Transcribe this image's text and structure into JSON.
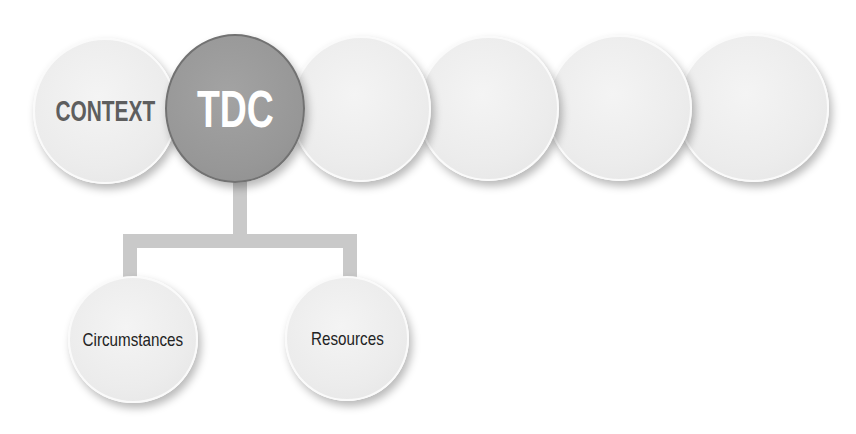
{
  "diagram": {
    "top_row": [
      {
        "id": "context",
        "label": "CONTEXT",
        "state": "default"
      },
      {
        "id": "tdc",
        "label": "TDC",
        "state": "active"
      },
      {
        "id": "empty-1",
        "label": "",
        "state": "default"
      },
      {
        "id": "empty-2",
        "label": "",
        "state": "default"
      },
      {
        "id": "empty-3",
        "label": "",
        "state": "default"
      },
      {
        "id": "empty-4",
        "label": "",
        "state": "default"
      }
    ],
    "children_of_tdc": [
      {
        "id": "circumstances",
        "label": "Circumstances"
      },
      {
        "id": "resources",
        "label": "Resources"
      }
    ],
    "colors": {
      "active_fill": "#979797",
      "active_border": "#727272",
      "default_fill": "#ececec",
      "connector": "#c9c9c9",
      "context_text": "#5e5e5e",
      "active_text": "#ffffff",
      "child_text": "#232323"
    }
  }
}
